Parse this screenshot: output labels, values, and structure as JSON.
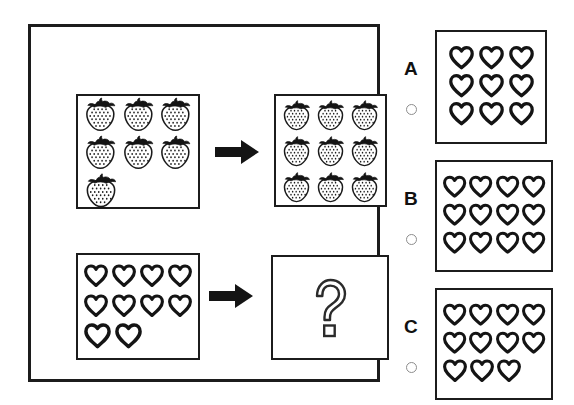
{
  "puzzle": {
    "type": "visual-analogy-counting",
    "title_text": "",
    "rows": [
      {
        "row_id": "example-row",
        "left": {
          "icon": "strawberry-icon",
          "item_name": "strawberry",
          "count": 7,
          "layout": [
            3,
            3,
            1
          ]
        },
        "arrow": "right-arrow-icon",
        "right": {
          "icon": "strawberry-icon",
          "item_name": "strawberry",
          "count": 9,
          "layout": [
            3,
            3,
            3
          ]
        }
      },
      {
        "row_id": "question-row",
        "left": {
          "icon": "heart-icon",
          "item_name": "heart",
          "count": 10,
          "layout": [
            4,
            4,
            2
          ]
        },
        "arrow": "right-arrow-icon",
        "right": {
          "icon": "question-mark-icon",
          "item_name": "question-mark",
          "label": "?",
          "count": 0,
          "layout": []
        }
      }
    ]
  },
  "options": [
    {
      "id": "option-a",
      "label": "A",
      "icon": "heart-icon",
      "item_name": "heart",
      "count": 9,
      "layout": [
        3,
        3,
        3
      ],
      "selected": false
    },
    {
      "id": "option-b",
      "label": "B",
      "icon": "heart-icon",
      "item_name": "heart",
      "count": 12,
      "layout": [
        4,
        4,
        4
      ],
      "selected": false
    },
    {
      "id": "option-c",
      "label": "C",
      "icon": "heart-icon",
      "item_name": "heart",
      "count": 11,
      "layout": [
        4,
        4,
        3
      ],
      "selected": false
    }
  ],
  "colors": {
    "ink": "#1c1c1c",
    "background": "#ffffff",
    "radio_outline": "#8d8d8d"
  }
}
